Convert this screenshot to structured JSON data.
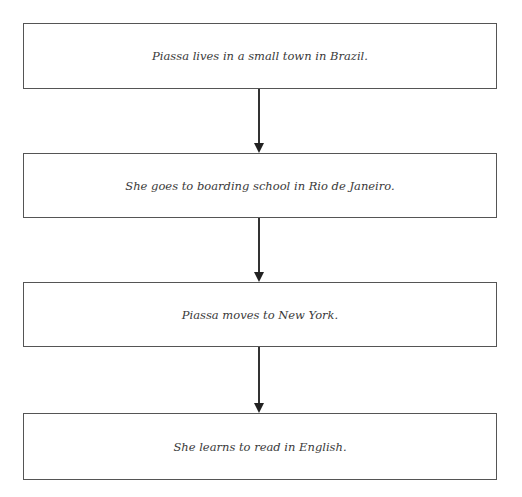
{
  "diagram": {
    "type": "flowchart",
    "direction": "top-to-bottom",
    "steps": [
      {
        "label": "Piassa lives in a small town in Brazil."
      },
      {
        "label": "She goes to boarding school in Rio de Janeiro."
      },
      {
        "label": "Piassa moves to New York."
      },
      {
        "label": "She learns to read in English."
      }
    ],
    "edges": [
      {
        "from": 0,
        "to": 1
      },
      {
        "from": 1,
        "to": 2
      },
      {
        "from": 2,
        "to": 3
      }
    ]
  }
}
